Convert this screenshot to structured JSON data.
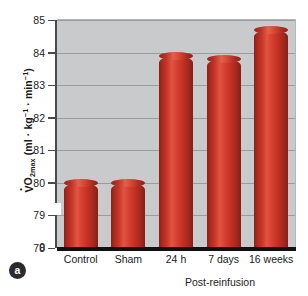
{
  "figure": {
    "panel_label": "a",
    "background_color": "#ffffff",
    "plot_background_color": "#c8cacb",
    "gridline_color": "#9a9c9e",
    "bar_color": "#c0392b",
    "bar_highlight_color": "#e05542",
    "bar_shadow_color": "#8d2118",
    "axis_color": "#111111"
  },
  "chart_data": {
    "type": "bar",
    "title": "",
    "subtitle": "",
    "xlabel": "",
    "ylabel_parts": {
      "v": "V",
      "o": "O",
      "sub": "2max",
      "units": " (ml · kg",
      "sup1": "−1",
      "mid": " · min",
      "sup2": "−1",
      "close": ")"
    },
    "ylabel": "V̇O2max (ml · kg−1 · min−1)",
    "categories": [
      "Control",
      "Sham",
      "24 h",
      "7 days",
      "16 weeks"
    ],
    "values": [
      80.0,
      80.0,
      83.9,
      83.8,
      84.7
    ],
    "ylim": [
      78,
      85
    ],
    "axis_break": true,
    "axis_break_between": [
      0,
      78
    ],
    "yticks": [
      "85",
      "84",
      "83",
      "82",
      "81",
      "80",
      "79",
      "78",
      "0"
    ],
    "ytick_values": [
      85,
      84,
      83,
      82,
      81,
      80,
      79,
      78,
      0
    ],
    "grid": true,
    "grid_axis": "y",
    "legend": "none",
    "annotation": {
      "bracket_label": "Post-reinfusion",
      "bracket_spans": [
        "24 h",
        "7 days",
        "16 weeks"
      ]
    }
  }
}
